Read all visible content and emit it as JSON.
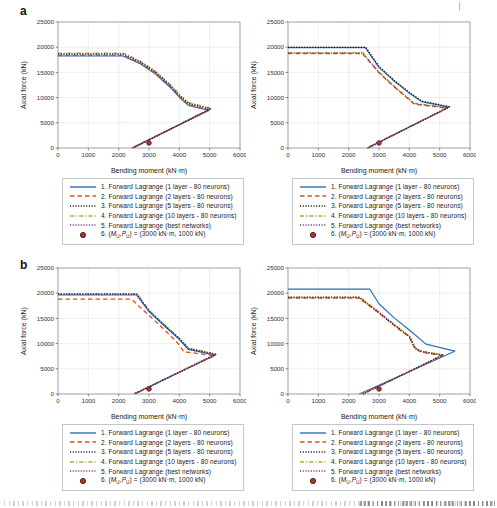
{
  "figure": {
    "panel_a_label": "a",
    "panel_b_label": "b",
    "axis": {
      "xlabel": "Bending moment (kN·m)",
      "ylabel": "Axial force (kN)",
      "xlim": [
        0,
        6000
      ],
      "ylim": [
        0,
        25000
      ],
      "xticks": [
        0,
        1000,
        2000,
        3000,
        4000,
        5000,
        6000
      ],
      "yticks": [
        0,
        5000,
        10000,
        15000,
        20000,
        25000
      ],
      "grid": true
    },
    "colors": {
      "blue": "#2e6fb3",
      "red": "#d95319",
      "black": "#1c1c1c",
      "green": "#9ab83c",
      "purple": "#7e2f8e",
      "marker_fill": "#b0372b",
      "marker_edge": "#4a1510",
      "grid": "#dde2ec",
      "axis_border": "#9aa2ab",
      "tick_text": "#333333",
      "label_text": "#222222"
    },
    "draw_order": [
      3,
      0,
      1,
      2,
      4
    ],
    "legend": {
      "items": [
        {
          "swatch": "solid",
          "color_key": "blue",
          "label": "1. Forward Lagrange (1 layer - 80 neurons)"
        },
        {
          "swatch": "dashed",
          "color_key": "red",
          "label": "2. Forward Lagrange (2 layers - 80 neurons)"
        },
        {
          "swatch": "dotted",
          "color_key": "black",
          "label": "3. Forward Lagrange (5 layers - 80 neurons)"
        },
        {
          "swatch": "dashdot",
          "color_key": "green",
          "label": "4. Forward Lagrange (10 layers - 80 neurons)"
        },
        {
          "swatch": "dotted",
          "color_key": "purple",
          "label": "5. Forward Lagrange (best networks)"
        },
        {
          "swatch": "marker",
          "color_key": "marker",
          "parts": {
            "prefix": "6. (",
            "sym1": "M",
            "sub1": "U",
            "comma": ",",
            "sym2": "P",
            "sub2": "U",
            "suffix": ") = (3000 kN·m, 1000 kN)"
          }
        }
      ]
    }
  },
  "chart_data": [
    {
      "id": "panel-a-left",
      "type": "line",
      "xlabel": "Bending moment (kN·m)",
      "ylabel": "Axial force (kN)",
      "xlim": [
        0,
        6000
      ],
      "ylim": [
        0,
        25000
      ],
      "series": [
        {
          "name": "1. Forward Lagrange (1 layer - 80 neurons)",
          "color_key": "blue",
          "dash": "solid",
          "points": [
            [
              0,
              18250
            ],
            [
              2140,
              18250
            ],
            [
              2700,
              16750
            ],
            [
              3200,
              14750
            ],
            [
              3700,
              12050
            ],
            [
              4050,
              9750
            ],
            [
              4300,
              8450
            ],
            [
              4970,
              7450
            ],
            [
              2430,
              0
            ]
          ]
        },
        {
          "name": "2. Forward Lagrange (2 layers - 80 neurons)",
          "color_key": "red",
          "dash": "dashed",
          "points": [
            [
              0,
              18400
            ],
            [
              2150,
              18400
            ],
            [
              2700,
              16900
            ],
            [
              3200,
              14900
            ],
            [
              3700,
              12200
            ],
            [
              4050,
              9900
            ],
            [
              4300,
              8600
            ],
            [
              4990,
              7560
            ],
            [
              2440,
              0
            ]
          ]
        },
        {
          "name": "3. Forward Lagrange (5 layers - 80 neurons)",
          "color_key": "black",
          "dash": "dotted",
          "points": [
            [
              0,
              18650
            ],
            [
              2150,
              18650
            ],
            [
              2700,
              17150
            ],
            [
              3200,
              15150
            ],
            [
              3700,
              12450
            ],
            [
              4050,
              10150
            ],
            [
              4310,
              8850
            ],
            [
              5020,
              7780
            ],
            [
              2480,
              0
            ]
          ]
        },
        {
          "name": "4. Forward Lagrange (10 layers - 80 neurons)",
          "color_key": "green",
          "dash": "dashdot",
          "points": [
            [
              0,
              18800
            ],
            [
              2160,
              18800
            ],
            [
              2700,
              17300
            ],
            [
              3200,
              15300
            ],
            [
              3700,
              12600
            ],
            [
              4060,
              10300
            ],
            [
              4320,
              9000
            ],
            [
              5050,
              7900
            ],
            [
              2500,
              0
            ]
          ]
        },
        {
          "name": "5. Forward Lagrange (best networks)",
          "color_key": "purple",
          "dash": "dotted",
          "points": [
            [
              0,
              18500
            ],
            [
              2150,
              18500
            ],
            [
              2700,
              17000
            ],
            [
              3200,
              15000
            ],
            [
              3700,
              12300
            ],
            [
              4050,
              10000
            ],
            [
              4300,
              8700
            ],
            [
              5000,
              7650
            ],
            [
              2450,
              0
            ]
          ]
        }
      ],
      "marker": {
        "name": "6. (MU,PU) = (3000 kN·m, 1000 kN)",
        "x": 3000,
        "y": 1000
      }
    },
    {
      "id": "panel-a-right",
      "type": "line",
      "xlabel": "Bending moment (kN·m)",
      "ylabel": "Axial force (kN)",
      "xlim": [
        0,
        6000
      ],
      "ylim": [
        0,
        25000
      ],
      "series": [
        {
          "name": "1. Forward Lagrange (1 layer - 80 neurons)",
          "color_key": "blue",
          "dash": "solid",
          "points": [
            [
              0,
              19900
            ],
            [
              2550,
              19900
            ],
            [
              3000,
              16000
            ],
            [
              3500,
              13300
            ],
            [
              4000,
              10900
            ],
            [
              4400,
              9200
            ],
            [
              5300,
              8100
            ],
            [
              2620,
              0
            ]
          ]
        },
        {
          "name": "2. Forward Lagrange (2 layers - 80 neurons)",
          "color_key": "red",
          "dash": "dashed",
          "points": [
            [
              0,
              18750
            ],
            [
              2450,
              18750
            ],
            [
              3000,
              14900
            ],
            [
              3500,
              12100
            ],
            [
              3950,
              9800
            ],
            [
              4160,
              8700
            ],
            [
              5250,
              7900
            ],
            [
              2600,
              0
            ]
          ]
        },
        {
          "name": "3. Forward Lagrange (5 layers - 80 neurons)",
          "color_key": "black",
          "dash": "dotted",
          "points": [
            [
              0,
              20000
            ],
            [
              2560,
              20000
            ],
            [
              3010,
              16100
            ],
            [
              3510,
              13400
            ],
            [
              4010,
              11000
            ],
            [
              4410,
              9300
            ],
            [
              5320,
              8200
            ],
            [
              2640,
              0
            ]
          ]
        },
        {
          "name": "4. Forward Lagrange (10 layers - 80 neurons)",
          "color_key": "green",
          "dash": "dashdot",
          "points": [
            [
              0,
              18950
            ],
            [
              2470,
              18950
            ],
            [
              3000,
              15100
            ],
            [
              3500,
              12300
            ],
            [
              3950,
              10000
            ],
            [
              4170,
              8900
            ],
            [
              5270,
              8000
            ],
            [
              2610,
              0
            ]
          ]
        },
        {
          "name": "5. Forward Lagrange (best networks)",
          "color_key": "purple",
          "dash": "dotted",
          "points": [
            [
              0,
              18830
            ],
            [
              2460,
              18830
            ],
            [
              3000,
              14980
            ],
            [
              3500,
              12180
            ],
            [
              3950,
              9880
            ],
            [
              4165,
              8780
            ],
            [
              5260,
              7950
            ],
            [
              2605,
              0
            ]
          ]
        }
      ],
      "marker": {
        "name": "6. (MU,PU) = (3000 kN·m, 1000 kN)",
        "x": 3000,
        "y": 1000
      }
    },
    {
      "id": "panel-b-left",
      "type": "line",
      "xlabel": "Bending moment (kN·m)",
      "ylabel": "Axial force (kN)",
      "xlim": [
        0,
        6000
      ],
      "ylim": [
        0,
        25000
      ],
      "series": [
        {
          "name": "1. Forward Lagrange (1 layer - 80 neurons)",
          "color_key": "blue",
          "dash": "solid",
          "points": [
            [
              0,
              19650
            ],
            [
              2590,
              19650
            ],
            [
              3000,
              16350
            ],
            [
              3500,
              13550
            ],
            [
              4000,
              10850
            ],
            [
              4290,
              8850
            ],
            [
              5180,
              7700
            ],
            [
              2510,
              0
            ]
          ]
        },
        {
          "name": "2. Forward Lagrange (2 layers - 80 neurons)",
          "color_key": "red",
          "dash": "dashed",
          "points": [
            [
              0,
              18800
            ],
            [
              2420,
              18800
            ],
            [
              3000,
              15600
            ],
            [
              3500,
              12800
            ],
            [
              3950,
              10100
            ],
            [
              4150,
              8400
            ],
            [
              5150,
              7600
            ],
            [
              2490,
              0
            ]
          ]
        },
        {
          "name": "3. Forward Lagrange (5 layers - 80 neurons)",
          "color_key": "black",
          "dash": "dotted",
          "points": [
            [
              0,
              19800
            ],
            [
              2600,
              19800
            ],
            [
              3000,
              16500
            ],
            [
              3500,
              13700
            ],
            [
              4000,
              11000
            ],
            [
              4300,
              9000
            ],
            [
              5200,
              7850
            ],
            [
              2520,
              0
            ]
          ]
        },
        {
          "name": "4. Forward Lagrange (10 layers - 80 neurons)",
          "color_key": "green",
          "dash": "dashdot",
          "points": [
            [
              0,
              19900
            ],
            [
              2610,
              19900
            ],
            [
              3000,
              16600
            ],
            [
              3500,
              13800
            ],
            [
              4000,
              11100
            ],
            [
              4310,
              9100
            ],
            [
              5210,
              7950
            ],
            [
              2530,
              0
            ]
          ]
        },
        {
          "name": "5. Forward Lagrange (best networks)",
          "color_key": "purple",
          "dash": "dotted",
          "points": [
            [
              0,
              19850
            ],
            [
              2600,
              19850
            ],
            [
              3000,
              16550
            ],
            [
              3500,
              13750
            ],
            [
              4000,
              11050
            ],
            [
              4305,
              9050
            ],
            [
              5205,
              7900
            ],
            [
              2525,
              0
            ]
          ]
        }
      ],
      "marker": {
        "name": "6. (MU,PU) = (3000 kN·m, 1000 kN)",
        "x": 3000,
        "y": 1000
      }
    },
    {
      "id": "panel-b-right",
      "type": "line",
      "xlabel": "Bending moment (kN·m)",
      "ylabel": "Axial force (kN)",
      "xlim": [
        0,
        6000
      ],
      "ylim": [
        0,
        25000
      ],
      "series": [
        {
          "name": "1. Forward Lagrange (1 layer - 80 neurons)",
          "color_key": "blue",
          "dash": "solid",
          "points": [
            [
              0,
              20800
            ],
            [
              2700,
              20800
            ],
            [
              3000,
              17900
            ],
            [
              3500,
              15100
            ],
            [
              4000,
              12700
            ],
            [
              4550,
              9900
            ],
            [
              5500,
              8500
            ],
            [
              2350,
              0
            ]
          ]
        },
        {
          "name": "2. Forward Lagrange (2 layers - 80 neurons)",
          "color_key": "red",
          "dash": "dashed",
          "points": [
            [
              0,
              19030
            ],
            [
              2340,
              19030
            ],
            [
              3000,
              16030
            ],
            [
              3500,
              13580
            ],
            [
              4000,
              11280
            ],
            [
              4190,
              8900
            ],
            [
              4400,
              8280
            ],
            [
              5090,
              7580
            ],
            [
              2460,
              0
            ]
          ]
        },
        {
          "name": "3. Forward Lagrange (5 layers - 80 neurons)",
          "color_key": "black",
          "dash": "dotted",
          "points": [
            [
              0,
              19150
            ],
            [
              2350,
              19150
            ],
            [
              3000,
              16150
            ],
            [
              3500,
              13700
            ],
            [
              4000,
              11400
            ],
            [
              4200,
              9000
            ],
            [
              4410,
              8400
            ],
            [
              5100,
              7700
            ],
            [
              2470,
              0
            ]
          ]
        },
        {
          "name": "4. Forward Lagrange (10 layers - 80 neurons)",
          "color_key": "green",
          "dash": "dashdot",
          "points": [
            [
              0,
              19250
            ],
            [
              2360,
              19250
            ],
            [
              3000,
              16250
            ],
            [
              3500,
              13800
            ],
            [
              4000,
              11500
            ],
            [
              4210,
              9100
            ],
            [
              4420,
              8500
            ],
            [
              5110,
              7800
            ],
            [
              2480,
              0
            ]
          ]
        },
        {
          "name": "5. Forward Lagrange (best networks)",
          "color_key": "purple",
          "dash": "dotted",
          "points": [
            [
              0,
              19200
            ],
            [
              2355,
              19200
            ],
            [
              3000,
              16200
            ],
            [
              3500,
              13750
            ],
            [
              4000,
              11450
            ],
            [
              4205,
              9050
            ],
            [
              4415,
              8450
            ],
            [
              5105,
              7750
            ],
            [
              2475,
              0
            ]
          ]
        }
      ],
      "marker": {
        "name": "6. (MU,PU) = (3000 kN·m, 1000 kN)",
        "x": 3000,
        "y": 1000
      }
    }
  ]
}
